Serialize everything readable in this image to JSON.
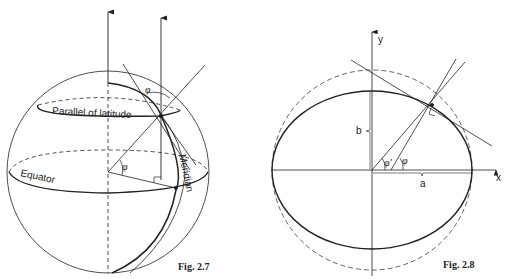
{
  "fig27": {
    "caption": "Fig. 2.7",
    "labels": {
      "parallel": "Parallel of latitude",
      "equator": "Equator",
      "meridian": "Meridian",
      "phi_top": "φ",
      "phi_center": "φ"
    }
  },
  "fig28": {
    "caption": "Fig. 2.8",
    "labels": {
      "y_axis": "y",
      "x_axis": "x",
      "a": "a",
      "b": "b",
      "phi_prime": "φ'",
      "phi": "φ"
    }
  }
}
